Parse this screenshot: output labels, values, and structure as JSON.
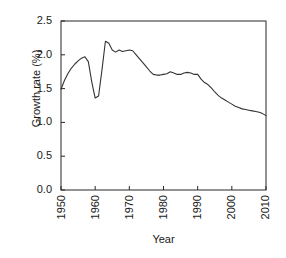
{
  "chart_data": {
    "type": "line",
    "title": "",
    "xlabel": "Year",
    "ylabel": "Growth rate (%)",
    "xlim": [
      1950,
      2010
    ],
    "ylim": [
      0.0,
      2.5
    ],
    "xticks": [
      1950,
      1960,
      1970,
      1980,
      1990,
      2000,
      2010
    ],
    "xtick_labels": [
      "1950",
      "1960",
      "1970",
      "1980",
      "1990",
      "2000",
      "2010"
    ],
    "yticks": [
      0.0,
      0.5,
      1.0,
      1.5,
      2.0,
      2.5
    ],
    "ytick_labels": [
      "0.0",
      "0.5",
      "1.0",
      "1.5",
      "2.0",
      "2.5"
    ],
    "grid": false,
    "legend": null,
    "line_color": "#333333",
    "line_width": 1.1,
    "series": [
      {
        "name": "World population growth rate",
        "x": [
          1950,
          1951,
          1952,
          1953,
          1954,
          1955,
          1956,
          1957,
          1958,
          1959,
          1960,
          1961,
          1962,
          1963,
          1964,
          1965,
          1966,
          1967,
          1968,
          1969,
          1970,
          1971,
          1972,
          1973,
          1974,
          1975,
          1976,
          1977,
          1978,
          1979,
          1980,
          1981,
          1982,
          1983,
          1984,
          1985,
          1986,
          1987,
          1988,
          1989,
          1990,
          1991,
          1992,
          1993,
          1994,
          1995,
          1996,
          1997,
          1998,
          1999,
          2000,
          2001,
          2002,
          2003,
          2004,
          2005,
          2006,
          2007,
          2008,
          2009,
          2010
        ],
        "y": [
          1.49,
          1.62,
          1.72,
          1.8,
          1.86,
          1.91,
          1.95,
          1.97,
          1.9,
          1.6,
          1.36,
          1.39,
          1.78,
          2.2,
          2.17,
          2.07,
          2.04,
          2.07,
          2.05,
          2.06,
          2.07,
          2.06,
          2.0,
          1.94,
          1.88,
          1.82,
          1.76,
          1.71,
          1.7,
          1.7,
          1.71,
          1.72,
          1.75,
          1.73,
          1.71,
          1.71,
          1.73,
          1.74,
          1.73,
          1.71,
          1.71,
          1.64,
          1.59,
          1.56,
          1.51,
          1.45,
          1.4,
          1.36,
          1.33,
          1.3,
          1.27,
          1.24,
          1.22,
          1.2,
          1.19,
          1.18,
          1.17,
          1.16,
          1.15,
          1.13,
          1.1
        ]
      }
    ]
  },
  "axis_titles": {
    "x": "Year",
    "y": "Growth rate (%)"
  }
}
